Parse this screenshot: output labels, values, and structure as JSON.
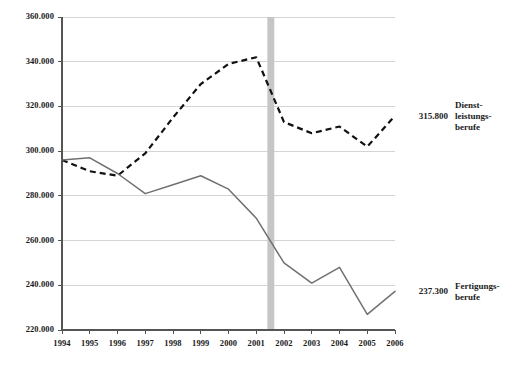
{
  "chart_data": {
    "type": "line",
    "title": "",
    "subtitle": "",
    "xlabel": "",
    "ylabel": "",
    "categories": [
      "1994",
      "1995",
      "1996",
      "1997",
      "1998",
      "1999",
      "2000",
      "2001",
      "2002",
      "2003",
      "2004",
      "2005",
      "2006"
    ],
    "x": [
      1994,
      1995,
      1996,
      1997,
      1998,
      1999,
      2000,
      2001,
      2002,
      2003,
      2004,
      2005,
      2006
    ],
    "xlim": [
      1994,
      2006
    ],
    "ylim": [
      220000,
      360000
    ],
    "ytick_values": [
      220000,
      240000,
      260000,
      280000,
      300000,
      320000,
      340000,
      360000
    ],
    "ytick_labels": [
      "220.000",
      "240.000",
      "260.000",
      "280.000",
      "300.000",
      "320.000",
      "340.000",
      "360.000"
    ],
    "grid": true,
    "legend_position": "right-inline-end-labels",
    "series": [
      {
        "name": "Dienst-\nleistungs-\nberufe",
        "name_lines": [
          "Dienst-",
          "leistungs-",
          "berufe"
        ],
        "style": "dashed",
        "color": "#111111",
        "end_label": "315.800",
        "values": [
          296000,
          291000,
          289000,
          299000,
          315000,
          330000,
          339000,
          342000,
          313000,
          308000,
          311000,
          302000,
          315800
        ]
      },
      {
        "name": "Fertigungs-\nberufe",
        "name_lines": [
          "Fertigungs-",
          "berufe"
        ],
        "style": "solid",
        "color": "#707070",
        "end_label": "237.300",
        "values": [
          296000,
          297000,
          290000,
          281000,
          285000,
          289000,
          283000,
          270000,
          250000,
          241000,
          248000,
          227000,
          237300
        ]
      }
    ],
    "annotations": [
      {
        "type": "vertical-band",
        "name": "recession-band",
        "color": "#c6c6c6",
        "x_start": 2001.4,
        "x_end": 2001.65
      }
    ]
  }
}
